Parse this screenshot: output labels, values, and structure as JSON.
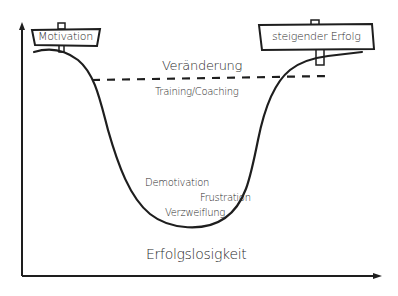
{
  "diagram": {
    "type": "change-curve",
    "axes": {
      "x_label": "",
      "y_label": ""
    },
    "signs": {
      "left": "Motivation",
      "right": "steigender Erfolg"
    },
    "threshold_line": {
      "label_above": "Veränderung",
      "label_below": "Training/Coaching",
      "style": "dashed"
    },
    "valley_labels": [
      "Demotivation",
      "Frustration",
      "Verzweiflung"
    ],
    "bottom_label": "Erfolgslosigkeit"
  },
  "colors": {
    "ink": "#1e1e1e",
    "background": "#ffffff"
  }
}
